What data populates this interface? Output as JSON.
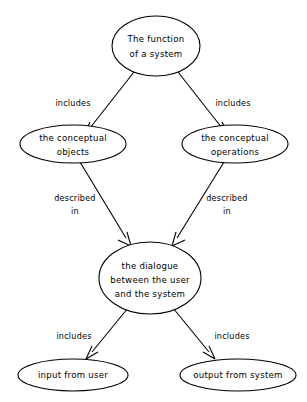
{
  "diagram": {
    "background_color": "#ffffff",
    "line_color": "#000000",
    "nodes": [
      {
        "id": "function",
        "lines": [
          "The function",
          "of a system"
        ],
        "line1": "The function",
        "line2": "of a system",
        "cx": 156,
        "cy": 46,
        "rx": 44,
        "ry": 30
      },
      {
        "id": "conceptual-objects",
        "lines": [
          "the conceptual",
          "objects"
        ],
        "line1": "the conceptual",
        "line2": "objects",
        "cx": 73,
        "cy": 144,
        "rx": 53,
        "ry": 19
      },
      {
        "id": "conceptual-operations",
        "lines": [
          "the conceptual",
          "operations"
        ],
        "line1": "the conceptual",
        "line2": "operations",
        "cx": 235,
        "cy": 144,
        "rx": 53,
        "ry": 19
      },
      {
        "id": "dialogue",
        "lines": [
          "the dialogue",
          "between the user",
          "and the system"
        ],
        "line1": "the dialogue",
        "line2": "between the user",
        "line3": "and the system",
        "cx": 150,
        "cy": 278,
        "rx": 51,
        "ry": 36
      },
      {
        "id": "input-from-user",
        "lines": [
          "input from user"
        ],
        "line1": "input from user",
        "cx": 73,
        "cy": 375,
        "rx": 55,
        "ry": 16
      },
      {
        "id": "output-from-system",
        "lines": [
          "output from system"
        ],
        "line1": "output from system",
        "cx": 238,
        "cy": 375,
        "rx": 58,
        "ry": 16
      }
    ],
    "edges": [
      {
        "id": "function-to-objects",
        "from": "function",
        "to": "conceptual-objects",
        "label": "includes",
        "label_x": 73,
        "label_y": 103
      },
      {
        "id": "function-to-operations",
        "from": "function",
        "to": "conceptual-operations",
        "label": "includes",
        "label_x": 233,
        "label_y": 103
      },
      {
        "id": "objects-to-dialogue",
        "from": "conceptual-objects",
        "to": "dialogue",
        "label_line1": "described",
        "label_line2": "in",
        "label_x": 75,
        "label_y": 203
      },
      {
        "id": "operations-to-dialogue",
        "from": "conceptual-operations",
        "to": "dialogue",
        "label_line1": "described",
        "label_line2": "in",
        "label_x": 227,
        "label_y": 203
      },
      {
        "id": "dialogue-to-input",
        "from": "dialogue",
        "to": "input-from-user",
        "label": "includes",
        "label_x": 74,
        "label_y": 336
      },
      {
        "id": "dialogue-to-output",
        "from": "dialogue",
        "to": "output-from-system",
        "label": "includes",
        "label_x": 232,
        "label_y": 336
      }
    ]
  }
}
